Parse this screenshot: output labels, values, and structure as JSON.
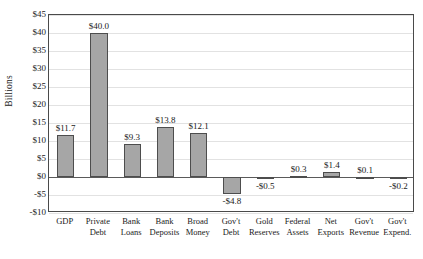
{
  "chart_data": {
    "type": "bar",
    "title": "",
    "xlabel": "",
    "ylabel": "Billions",
    "ylim": [
      -10,
      45
    ],
    "grid": true,
    "legend": "none",
    "ytick_labels": [
      "$45",
      "$40",
      "$35",
      "$30",
      "$25",
      "$20",
      "$15",
      "$10",
      "$5",
      "$0",
      "-$5",
      "-$10"
    ],
    "ytick_values": [
      45,
      40,
      35,
      30,
      25,
      20,
      15,
      10,
      5,
      0,
      -5,
      -10
    ],
    "categories": [
      "GDP",
      "Private Debt",
      "Bank Loans",
      "Bank Deposits",
      "Broad Money",
      "Gov't Debt",
      "Gold Reserves",
      "Federal Assets",
      "Net Exports",
      "Gov't Revenue",
      "Gov't Expend."
    ],
    "category_lines": [
      [
        "GDP"
      ],
      [
        "Private",
        "Debt"
      ],
      [
        "Bank",
        "Loans"
      ],
      [
        "Bank",
        "Deposits"
      ],
      [
        "Broad",
        "Money"
      ],
      [
        "Gov't",
        "Debt"
      ],
      [
        "Gold",
        "Reserves"
      ],
      [
        "Federal",
        "Assets"
      ],
      [
        "Net",
        "Exports"
      ],
      [
        "Gov't",
        "Revenue"
      ],
      [
        "Gov't",
        "Expend."
      ]
    ],
    "values": [
      11.7,
      40.0,
      9.3,
      13.8,
      12.1,
      -4.8,
      -0.5,
      0.3,
      1.4,
      0.1,
      -0.2
    ],
    "data_labels": [
      "$11.7",
      "$40.0",
      "$9.3",
      "$13.8",
      "$12.1",
      "-$4.8",
      "-$0.5",
      "$0.3",
      "$1.4",
      "$0.1",
      "-$0.2"
    ],
    "colors": {
      "bar_fill": "#a6a6a6",
      "bar_edge": "#4d4d4d",
      "grid": "#e2e2e2",
      "axis": "#4a4a4a",
      "text": "#1a1a1a",
      "background": "#ffffff"
    }
  }
}
